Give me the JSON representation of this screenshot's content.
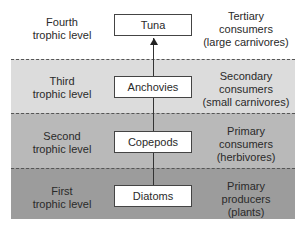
{
  "levels": [
    {
      "level": "Fourth trophic level",
      "level_lines": [
        "Fourth",
        "trophic level"
      ],
      "organism": "Tuna",
      "role_lines": [
        "Tertiary",
        "consumers",
        "(large carnivores)"
      ],
      "band_color": "#ffffff"
    },
    {
      "level": "Third trophic level",
      "level_lines": [
        "Third",
        "trophic level"
      ],
      "organism": "Anchovies",
      "role_lines": [
        "Secondary",
        "consumers",
        "(small carnivores)"
      ],
      "band_color": "#dcdcdc"
    },
    {
      "level": "Second trophic level",
      "level_lines": [
        "Second",
        "trophic level"
      ],
      "organism": "Copepods",
      "role_lines": [
        "Primary",
        "consumers",
        "(herbivores)"
      ],
      "band_color": "#b9b9b9"
    },
    {
      "level": "First trophic level",
      "level_lines": [
        "First",
        "trophic level"
      ],
      "organism": "Diatoms",
      "role_lines": [
        "Primary",
        "producers",
        "(plants)"
      ],
      "band_color": "#9c9c9c"
    }
  ],
  "arrow_direction": "up"
}
